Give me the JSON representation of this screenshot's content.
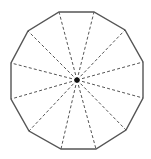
{
  "diagram": {
    "shape": "regular dodecagon",
    "sides": 12,
    "center": [
      77,
      80
    ],
    "center_dot_radius": 2.6,
    "vertices": [
      [
        59,
        12
      ],
      [
        94,
        12
      ],
      [
        125,
        30
      ],
      [
        143,
        62
      ],
      [
        143,
        98
      ],
      [
        126,
        130
      ],
      [
        96,
        149
      ],
      [
        61,
        149
      ],
      [
        29,
        131
      ],
      [
        11,
        99
      ],
      [
        11,
        63
      ],
      [
        28,
        31
      ]
    ],
    "colors": {
      "outline": "#555555",
      "spokes": "#555555",
      "center_dot": "#111111",
      "background": "#ffffff"
    },
    "outline_width": 1.4,
    "spoke_width": 1,
    "spoke_dash": "3,2.2"
  }
}
